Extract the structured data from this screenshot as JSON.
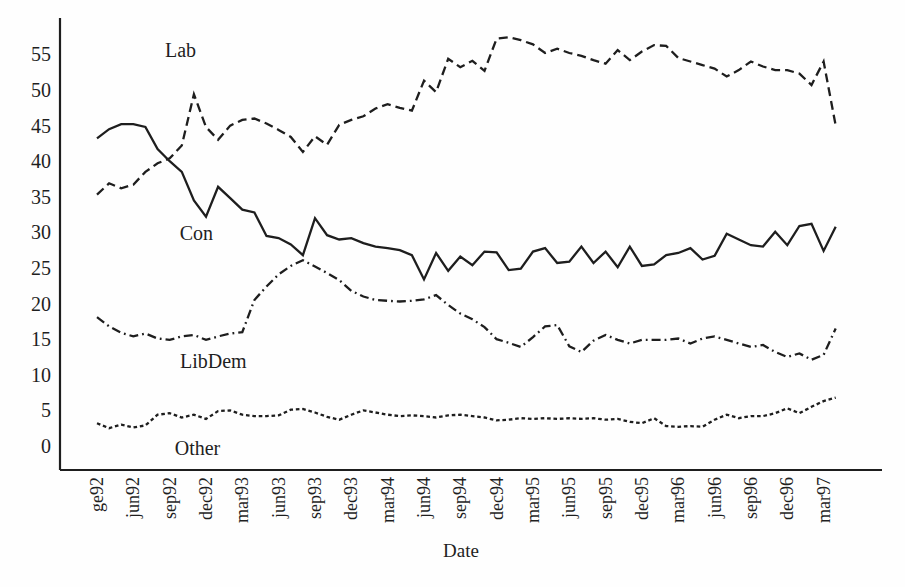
{
  "chart_data": {
    "type": "line",
    "title": "",
    "xlabel": "Date",
    "ylabel": "",
    "ylim": [
      0,
      58
    ],
    "grid": false,
    "legend": "inline-labels",
    "line_color": "#1e1e1e",
    "x_tick_labels": [
      "ge92",
      "jun92",
      "sep92",
      "dec92",
      "mar93",
      "jun93",
      "sep93",
      "dec93",
      "mar94",
      "jun94",
      "sep94",
      "dec94",
      "mar95",
      "jun95",
      "sep95",
      "dec95",
      "mar96",
      "jun96",
      "sep96",
      "dec96",
      "mar97"
    ],
    "tick_every": 3,
    "n_points": 62,
    "y_ticks": [
      0,
      5,
      10,
      15,
      20,
      25,
      30,
      35,
      40,
      45,
      50,
      55
    ],
    "series": [
      {
        "name": "Lab",
        "style": "dashed",
        "values": [
          35.3,
          36.9,
          36.2,
          36.7,
          38.5,
          39.7,
          40.4,
          42.2,
          49.4,
          44.8,
          43.0,
          45.0,
          45.8,
          46.0,
          45.3,
          44.4,
          43.4,
          41.3,
          43.5,
          42.3,
          45.1,
          45.8,
          46.3,
          47.4,
          48.0,
          47.5,
          47.1,
          51.3,
          49.7,
          54.4,
          53.2,
          54.1,
          52.7,
          57.2,
          57.4,
          57.0,
          56.4,
          55.2,
          55.8,
          55.2,
          54.8,
          54.2,
          53.7,
          55.6,
          54.2,
          55.4,
          56.3,
          56.2,
          54.5,
          54.0,
          53.5,
          53.0,
          51.9,
          52.8,
          54.0,
          53.3,
          52.8,
          52.8,
          52.3,
          50.7,
          54.0,
          45.0
        ]
      },
      {
        "name": "Con",
        "style": "solid",
        "values": [
          43.2,
          44.5,
          45.2,
          45.2,
          44.8,
          41.7,
          40.0,
          38.5,
          34.5,
          32.2,
          36.4,
          34.8,
          33.2,
          32.8,
          29.5,
          29.2,
          28.3,
          26.8,
          32.0,
          29.6,
          29.0,
          29.2,
          28.5,
          28.0,
          27.8,
          27.5,
          26.8,
          23.4,
          27.1,
          24.6,
          26.6,
          25.4,
          27.3,
          27.2,
          24.7,
          24.9,
          27.3,
          27.8,
          25.7,
          25.9,
          28.0,
          25.7,
          27.3,
          25.1,
          28.0,
          25.3,
          25.5,
          26.8,
          27.1,
          27.8,
          26.2,
          26.7,
          29.8,
          29.0,
          28.2,
          28.0,
          30.1,
          28.2,
          30.9,
          31.2,
          27.4,
          30.8
        ]
      },
      {
        "name": "LibDem",
        "style": "dashdot",
        "values": [
          18.1,
          16.8,
          15.9,
          15.4,
          15.8,
          15.1,
          14.9,
          15.4,
          15.6,
          14.9,
          15.4,
          15.8,
          16.0,
          20.5,
          22.4,
          24.1,
          25.3,
          26.1,
          25.2,
          24.3,
          23.3,
          21.8,
          21.0,
          20.5,
          20.4,
          20.3,
          20.4,
          20.6,
          21.2,
          19.8,
          18.6,
          17.8,
          16.7,
          15.0,
          14.5,
          13.9,
          15.3,
          16.8,
          17.0,
          14.0,
          13.2,
          14.8,
          15.6,
          14.9,
          14.4,
          14.9,
          14.9,
          14.9,
          15.1,
          14.4,
          15.1,
          15.4,
          14.9,
          14.4,
          13.9,
          14.2,
          13.2,
          12.5,
          13.0,
          12.1,
          12.8,
          16.5
        ]
      },
      {
        "name": "Other",
        "style": "dotted",
        "values": [
          3.2,
          2.5,
          3.0,
          2.6,
          2.9,
          4.4,
          4.6,
          4.0,
          4.4,
          3.8,
          4.9,
          5.0,
          4.4,
          4.2,
          4.2,
          4.3,
          5.1,
          5.2,
          4.7,
          4.1,
          3.7,
          4.4,
          5.0,
          4.7,
          4.4,
          4.2,
          4.3,
          4.2,
          4.0,
          4.3,
          4.4,
          4.2,
          4.0,
          3.6,
          3.7,
          3.9,
          3.8,
          3.9,
          3.8,
          3.9,
          3.8,
          3.9,
          3.7,
          3.8,
          3.4,
          3.2,
          3.9,
          2.8,
          2.7,
          2.8,
          2.7,
          3.7,
          4.4,
          3.9,
          4.2,
          4.2,
          4.6,
          5.3,
          4.6,
          5.5,
          6.3,
          6.8
        ]
      }
    ],
    "series_labels": [
      {
        "text": "Lab",
        "x_index": 6.9,
        "y_value": 54.6
      },
      {
        "text": "Con",
        "x_index": 8.2,
        "y_value": 29.0
      },
      {
        "text": "LibDem",
        "x_index": 9.6,
        "y_value": 11.0
      },
      {
        "text": "Other",
        "x_index": 8.3,
        "y_value": -1.2
      }
    ]
  }
}
